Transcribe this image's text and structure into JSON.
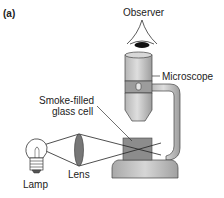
{
  "figure": {
    "panel_label": "(a)",
    "labels": {
      "observer": "Observer",
      "microscope": "Microscope",
      "cell_line1": "Smoke-filled",
      "cell_line2": "glass cell",
      "lamp": "Lamp",
      "lens": "Lens"
    },
    "colors": {
      "background": "#ffffff",
      "text": "#222222",
      "outline": "#333333",
      "metal_light": "#c8c8c8",
      "metal_mid": "#a9a9a9",
      "cell_fill": "#8c8c8c",
      "lens_fill": "#777777",
      "eye_pupil": "#111111"
    }
  }
}
